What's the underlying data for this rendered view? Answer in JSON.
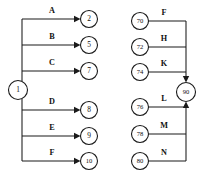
{
  "diagram": {
    "type": "node-link-fan-diagram",
    "canvas": {
      "width": 211,
      "height": 175,
      "background": "#ffffff"
    },
    "stroke_color": "#1a1a1a",
    "text_color": "#111111",
    "left_group": {
      "source_node": {
        "id": "1",
        "label": "1",
        "cx": 18,
        "cy": 90,
        "r": 9.5
      },
      "trunk_x": 22,
      "trunk_top_y": 19,
      "trunk_bottom_y": 161,
      "target_nodes": [
        {
          "label": "2",
          "cx": 89,
          "cy": 19,
          "r": 8.5
        },
        {
          "label": "5",
          "cx": 89,
          "cy": 45,
          "r": 8.5
        },
        {
          "label": "7",
          "cx": 89,
          "cy": 71,
          "r": 8.5
        },
        {
          "label": "8",
          "cx": 89,
          "cy": 110,
          "r": 8.5
        },
        {
          "label": "9",
          "cx": 89,
          "cy": 136,
          "r": 8.5
        },
        {
          "label": "10",
          "cx": 89,
          "cy": 161,
          "r": 8.5
        }
      ],
      "edge_labels": [
        {
          "text": "A",
          "x": 52,
          "y": 13,
          "target": "2"
        },
        {
          "text": "B",
          "x": 52,
          "y": 39,
          "target": "5"
        },
        {
          "text": "C",
          "x": 52,
          "y": 65,
          "target": "7"
        },
        {
          "text": "D",
          "x": 52,
          "y": 104,
          "target": "8"
        },
        {
          "text": "E",
          "x": 52,
          "y": 130,
          "target": "9"
        },
        {
          "text": "F",
          "x": 52,
          "y": 155,
          "target": "10"
        }
      ]
    },
    "right_group": {
      "sink_node": {
        "id": "90",
        "label": "90",
        "cx": 186,
        "cy": 92,
        "r": 9.5
      },
      "trunk_x": 186,
      "trunk_top_y": 21,
      "trunk_bottom_y": 161,
      "source_nodes": [
        {
          "label": "70",
          "cx": 140,
          "cy": 21,
          "r": 8.5
        },
        {
          "label": "72",
          "cx": 140,
          "cy": 47,
          "r": 8.5
        },
        {
          "label": "74",
          "cx": 140,
          "cy": 72,
          "r": 8.5
        },
        {
          "label": "76",
          "cx": 140,
          "cy": 107,
          "r": 8.5
        },
        {
          "label": "78",
          "cx": 140,
          "cy": 134,
          "r": 8.5
        },
        {
          "label": "80",
          "cx": 140,
          "cy": 161,
          "r": 8.5
        }
      ],
      "edge_labels": [
        {
          "text": "F",
          "x": 164,
          "y": 15,
          "source": "70"
        },
        {
          "text": "H",
          "x": 164,
          "y": 41,
          "source": "72"
        },
        {
          "text": "K",
          "x": 164,
          "y": 66,
          "source": "74"
        },
        {
          "text": "L",
          "x": 164,
          "y": 101,
          "source": "76"
        },
        {
          "text": "M",
          "x": 164,
          "y": 128,
          "source": "78"
        },
        {
          "text": "N",
          "x": 164,
          "y": 155,
          "source": "80"
        }
      ]
    }
  }
}
